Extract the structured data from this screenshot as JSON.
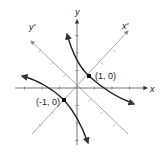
{
  "diagram": {
    "axes": {
      "x_label": "x",
      "y_label": "y",
      "x_prime_label": "x'",
      "y_prime_label": "y'"
    },
    "points": [
      {
        "label": "(1, 0)",
        "x_prime": 1,
        "y_prime": 0
      },
      {
        "label": "(-1, 0)",
        "x_prime": -1,
        "y_prime": 0
      }
    ],
    "curve": "hyperbola x'^2 - y'^2 = 1 (branches in quadrants I and III, rotated 45°)",
    "colors": {
      "axis": "#555555",
      "rotated_axis": "#9a9a9a",
      "curve": "#222222"
    }
  }
}
